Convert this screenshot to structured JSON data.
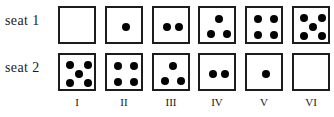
{
  "figure": {
    "rows": [
      {
        "label": "seat 1"
      },
      {
        "label": "seat 2"
      }
    ],
    "column_labels": [
      "I",
      "II",
      "III",
      "IV",
      "V",
      "VI"
    ],
    "colors": {
      "die_border": "#1c1c1c",
      "pip": "#000000",
      "background": "#ffffff",
      "text": "#1a1a1a"
    }
  },
  "chart_data": {
    "type": "table",
    "title": "",
    "xlabel": "",
    "ylabel": "",
    "categories": [
      "I",
      "II",
      "III",
      "IV",
      "V",
      "VI"
    ],
    "series": [
      {
        "name": "seat 1",
        "values": [
          0,
          1,
          2,
          3,
          4,
          5
        ]
      },
      {
        "name": "seat 2",
        "values": [
          5,
          4,
          3,
          2,
          1,
          0
        ]
      }
    ],
    "cells": [
      {
        "row": "seat 1",
        "column": "I",
        "pips": 0,
        "face": "blank"
      },
      {
        "row": "seat 1",
        "column": "II",
        "pips": 1,
        "face": "center"
      },
      {
        "row": "seat 1",
        "column": "III",
        "pips": 2,
        "face": "two-horizontal"
      },
      {
        "row": "seat 1",
        "column": "IV",
        "pips": 3,
        "face": "triangle-top-center"
      },
      {
        "row": "seat 1",
        "column": "V",
        "pips": 4,
        "face": "four-corners"
      },
      {
        "row": "seat 1",
        "column": "VI",
        "pips": 5,
        "face": "quincunx"
      },
      {
        "row": "seat 2",
        "column": "I",
        "pips": 5,
        "face": "quincunx"
      },
      {
        "row": "seat 2",
        "column": "II",
        "pips": 4,
        "face": "four-corners"
      },
      {
        "row": "seat 2",
        "column": "III",
        "pips": 3,
        "face": "triangle-top-center"
      },
      {
        "row": "seat 2",
        "column": "IV",
        "pips": 2,
        "face": "two-horizontal"
      },
      {
        "row": "seat 2",
        "column": "V",
        "pips": 1,
        "face": "center"
      },
      {
        "row": "seat 2",
        "column": "VI",
        "pips": 0,
        "face": "blank"
      }
    ]
  }
}
